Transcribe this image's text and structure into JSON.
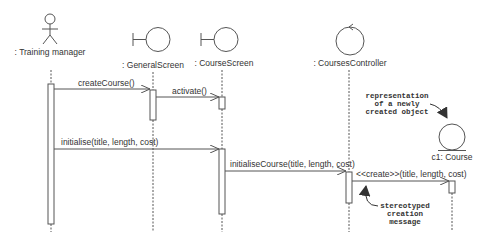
{
  "diagram": {
    "type": "UML sequence diagram",
    "colors": {
      "line": "#555555",
      "text": "#333333",
      "background": "#ffffff"
    },
    "lifelines": [
      {
        "id": "training-manager",
        "kind": "actor",
        "label": ": Training manager"
      },
      {
        "id": "general-screen",
        "kind": "boundary",
        "label": ": GeneralScreen"
      },
      {
        "id": "course-screen",
        "kind": "boundary",
        "label": ": CourseScreen"
      },
      {
        "id": "courses-controller",
        "kind": "control",
        "label": ": CoursesController"
      },
      {
        "id": "c1-course",
        "kind": "entity",
        "label": "c1: Course"
      }
    ],
    "messages": [
      {
        "from": "training-manager",
        "to": "general-screen",
        "label": "createCourse()"
      },
      {
        "from": "general-screen",
        "to": "course-screen",
        "label": "activate()"
      },
      {
        "from": "training-manager",
        "to": "course-screen",
        "label": "initialise(title, length, cost)"
      },
      {
        "from": "course-screen",
        "to": "courses-controller",
        "label": "initialiseCourse(title, length, cost)"
      },
      {
        "from": "courses-controller",
        "to": "c1-course",
        "label": "<<create>>(title, length, cost)"
      }
    ],
    "notes": {
      "new_object": [
        "representation",
        "of a newly",
        "created object"
      ],
      "stereotype": [
        "stereotyped",
        "creation",
        "message"
      ]
    }
  }
}
